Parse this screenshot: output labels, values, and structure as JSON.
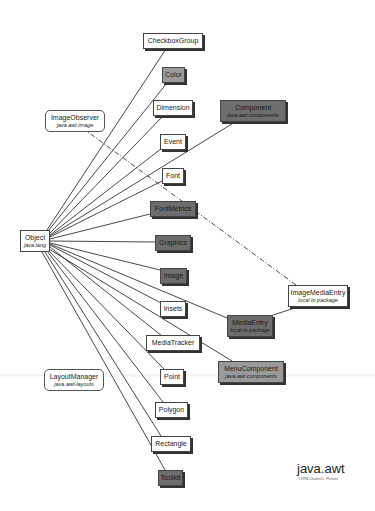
{
  "diagram": {
    "title": "java.awt",
    "credit": "©1996 Charles L. Perkins",
    "root": {
      "id": "object",
      "label": "Object",
      "sub": "java.lang"
    },
    "nodes": [
      {
        "id": "checkboxgroup",
        "label": "CheckboxGroup",
        "sub": "",
        "shade": "light",
        "x": 143,
        "y": 33,
        "w": 60,
        "h": 16
      },
      {
        "id": "color",
        "label": "Color",
        "sub": "",
        "shade": "mid",
        "x": 162,
        "y": 67,
        "w": 23,
        "h": 16
      },
      {
        "id": "dimension",
        "label": "Dimension",
        "sub": "",
        "shade": "light",
        "x": 153,
        "y": 100,
        "w": 40,
        "h": 16
      },
      {
        "id": "component",
        "label": "Component",
        "sub": "java.awt.components",
        "shade": "dark",
        "x": 220,
        "y": 100,
        "w": 66,
        "h": 22
      },
      {
        "id": "event",
        "label": "Event",
        "sub": "",
        "shade": "light",
        "x": 160,
        "y": 134,
        "w": 26,
        "h": 16
      },
      {
        "id": "font",
        "label": "Font",
        "sub": "",
        "shade": "light",
        "x": 162,
        "y": 168,
        "w": 22,
        "h": 16
      },
      {
        "id": "fontmetrics",
        "label": "FontMetrics",
        "sub": "",
        "shade": "dark",
        "x": 150,
        "y": 201,
        "w": 46,
        "h": 16
      },
      {
        "id": "graphics",
        "label": "Graphics",
        "sub": "",
        "shade": "dark",
        "x": 155,
        "y": 235,
        "w": 36,
        "h": 16
      },
      {
        "id": "image",
        "label": "Image",
        "sub": "",
        "shade": "dark",
        "x": 160,
        "y": 268,
        "w": 27,
        "h": 16
      },
      {
        "id": "insets",
        "label": "Insets",
        "sub": "",
        "shade": "light",
        "x": 160,
        "y": 301,
        "w": 26,
        "h": 16
      },
      {
        "id": "mediaentry",
        "label": "MediaEntry",
        "sub": "local to package",
        "shade": "dark",
        "x": 227,
        "y": 315,
        "w": 46,
        "h": 22
      },
      {
        "id": "imagemediaentry",
        "label": "ImageMediaEntry",
        "sub": "local to package",
        "shade": "light",
        "x": 288,
        "y": 285,
        "w": 60,
        "h": 22
      },
      {
        "id": "mediatracker",
        "label": "MediaTracker",
        "sub": "",
        "shade": "light",
        "x": 146,
        "y": 335,
        "w": 54,
        "h": 16
      },
      {
        "id": "menucomponent",
        "label": "MenuComponent",
        "sub": "java.awt.components",
        "shade": "mid",
        "x": 218,
        "y": 361,
        "w": 66,
        "h": 22
      },
      {
        "id": "point",
        "label": "Point",
        "sub": "",
        "shade": "light",
        "x": 160,
        "y": 369,
        "w": 24,
        "h": 16
      },
      {
        "id": "polygon",
        "label": "Polygon",
        "sub": "",
        "shade": "light",
        "x": 155,
        "y": 402,
        "w": 33,
        "h": 16
      },
      {
        "id": "rectangle",
        "label": "Rectangle",
        "sub": "",
        "shade": "light",
        "x": 151,
        "y": 436,
        "w": 40,
        "h": 16
      },
      {
        "id": "toolkit",
        "label": "Toolkit",
        "sub": "",
        "shade": "dark",
        "x": 158,
        "y": 470,
        "w": 25,
        "h": 16
      }
    ],
    "interfaces": [
      {
        "id": "imageobserver",
        "label": "ImageObserver",
        "sub": "java.awt.image",
        "x": 45,
        "y": 110,
        "w": 60,
        "h": 22
      },
      {
        "id": "layoutmanager",
        "label": "LayoutManager",
        "sub": "java.awt-layouts",
        "x": 44,
        "y": 369,
        "w": 60,
        "h": 22
      }
    ],
    "root_box": {
      "x": 20,
      "y": 230,
      "w": 30,
      "h": 22
    },
    "edges": [
      {
        "from": "object",
        "to": "checkboxgroup",
        "x1": 47,
        "y1": 230,
        "x2": 166,
        "y2": 49
      },
      {
        "from": "object",
        "to": "color",
        "x1": 48,
        "y1": 231,
        "x2": 167,
        "y2": 83
      },
      {
        "from": "object",
        "to": "dimension",
        "x1": 50,
        "y1": 233,
        "x2": 163,
        "y2": 116
      },
      {
        "from": "object",
        "to": "event",
        "x1": 50,
        "y1": 235,
        "x2": 162,
        "y2": 148
      },
      {
        "from": "object",
        "to": "font",
        "x1": 50,
        "y1": 237,
        "x2": 162,
        "y2": 181
      },
      {
        "from": "object",
        "to": "component",
        "x1": 50,
        "y1": 236,
        "x2": 235,
        "y2": 122
      },
      {
        "from": "object",
        "to": "fontmetrics",
        "x1": 50,
        "y1": 239,
        "x2": 150,
        "y2": 214
      },
      {
        "from": "object",
        "to": "graphics",
        "x1": 50,
        "y1": 241,
        "x2": 155,
        "y2": 242
      },
      {
        "from": "object",
        "to": "image",
        "x1": 50,
        "y1": 243,
        "x2": 160,
        "y2": 270
      },
      {
        "from": "object",
        "to": "insets",
        "x1": 50,
        "y1": 245,
        "x2": 161,
        "y2": 303
      },
      {
        "from": "object",
        "to": "mediaentry",
        "x1": 50,
        "y1": 244,
        "x2": 227,
        "y2": 318
      },
      {
        "from": "object",
        "to": "mediatracker",
        "x1": 50,
        "y1": 247,
        "x2": 162,
        "y2": 336
      },
      {
        "from": "object",
        "to": "menucomponent",
        "x1": 49,
        "y1": 249,
        "x2": 232,
        "y2": 361
      },
      {
        "from": "object",
        "to": "point",
        "x1": 48,
        "y1": 250,
        "x2": 164,
        "y2": 369
      },
      {
        "from": "object",
        "to": "polygon",
        "x1": 47,
        "y1": 251,
        "x2": 163,
        "y2": 402
      },
      {
        "from": "object",
        "to": "rectangle",
        "x1": 45,
        "y1": 252,
        "x2": 161,
        "y2": 436
      },
      {
        "from": "object",
        "to": "toolkit",
        "x1": 42,
        "y1": 252,
        "x2": 165,
        "y2": 470
      },
      {
        "from": "mediaentry",
        "to": "imagemediaentry",
        "x1": 273,
        "y1": 315,
        "x2": 298,
        "y2": 307
      }
    ],
    "dashed_edges": [
      {
        "from": "imagemediaentry",
        "to": "imageobserver",
        "x1": 296,
        "y1": 285,
        "x2": 88,
        "y2": 132
      }
    ],
    "colors": {
      "line": "#333333",
      "light_box": "#ffffff",
      "mid_box": "#9a9a9a",
      "dark_box": "#6d6d6d",
      "shadow": "#333333"
    }
  }
}
